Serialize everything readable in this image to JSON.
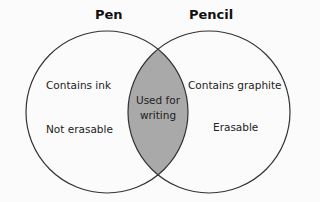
{
  "diagram": {
    "type": "venn",
    "sets": [
      {
        "name": "Pen",
        "items": [
          "Contains ink",
          "Not erasable"
        ]
      },
      {
        "name": "Pencil",
        "items": [
          "Contains graphite",
          "Erasable"
        ]
      }
    ],
    "intersection": {
      "line1": "Used for",
      "line2": "writing"
    },
    "colors": {
      "intersection_fill": "#a9a9a9",
      "outline": "#333333",
      "background": "#fbfbfb"
    }
  }
}
